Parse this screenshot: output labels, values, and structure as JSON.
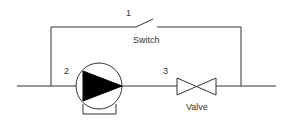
{
  "diagram": {
    "title": "",
    "components": [
      {
        "id": "1",
        "number_label": "1",
        "name_label": "Switch",
        "type": "switch"
      },
      {
        "id": "2",
        "number_label": "2",
        "name_label": "",
        "type": "pump"
      },
      {
        "id": "3",
        "number_label": "3",
        "name_label": "Valve",
        "type": "valve"
      }
    ],
    "colors": {
      "line": "#333333",
      "fill": "#000000",
      "background": "#ffffff"
    }
  }
}
